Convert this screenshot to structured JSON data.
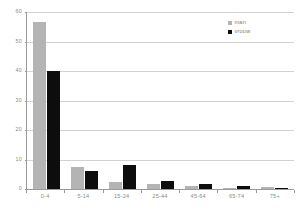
{
  "chart_data": {
    "type": "bar",
    "title": "",
    "subtitle": "",
    "xlabel": "",
    "ylabel": "",
    "categories": [
      "0-4",
      "5-14",
      "15-24",
      "25-44",
      "45-64",
      "65-74",
      "75+"
    ],
    "series": [
      {
        "name": "man",
        "color": "#b4b4b4",
        "values": [
          56.5,
          7.3,
          2.4,
          1.8,
          0.9,
          0.3,
          0.7
        ]
      },
      {
        "name": "vrouw",
        "color": "#0d0d0d",
        "values": [
          40.0,
          6.2,
          8.1,
          2.6,
          1.7,
          1.1,
          0.4
        ]
      }
    ],
    "ylim": [
      0,
      60
    ],
    "yticks": [
      0,
      10,
      20,
      30,
      40,
      50,
      60
    ],
    "ytick_labels": [
      "0",
      "10",
      "20",
      "30",
      "40",
      "50",
      "60"
    ],
    "grid": true,
    "grid_axis": "y",
    "legend_position": "top-right",
    "annotations": []
  },
  "legend": {
    "entries": [
      {
        "label": "man",
        "swatch": "legend-swatch-man"
      },
      {
        "label": "vrouw",
        "swatch": "legend-swatch-vrouw"
      }
    ]
  },
  "colors": {
    "man": "#b4b4b4",
    "vrouw": "#0d0d0d",
    "grid": "#d2d2d2",
    "axis": "#9a9a9a",
    "tick_text": "#8a8a8a",
    "background": "#ffffff"
  }
}
